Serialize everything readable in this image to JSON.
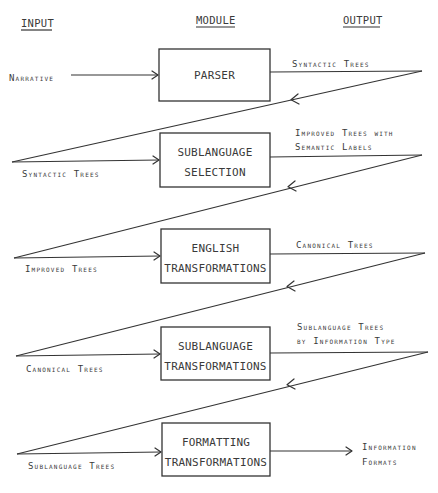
{
  "headers": {
    "input": "INPUT",
    "module": "MODULE",
    "output": "OUTPUT"
  },
  "modules": [
    {
      "lines": [
        "PARSER"
      ]
    },
    {
      "lines": [
        "SUBLANGUAGE",
        "SELECTION"
      ]
    },
    {
      "lines": [
        "ENGLISH",
        "TRANSFORMATIONS"
      ]
    },
    {
      "lines": [
        "SUBLANGUAGE",
        "TRANSFORMATIONS"
      ]
    },
    {
      "lines": [
        "FORMATTING",
        "TRANSFORMATIONS"
      ]
    }
  ],
  "inputs": [
    {
      "label": "Narrative"
    },
    {
      "label": "Syntactic Trees"
    },
    {
      "label": "Improved Trees"
    },
    {
      "label": "Canonical Trees"
    },
    {
      "label": "Sublanguage Trees"
    }
  ],
  "outputs": [
    {
      "lines": [
        "Syntactic Trees"
      ]
    },
    {
      "lines": [
        "Improved Trees with",
        "Semantic Labels"
      ]
    },
    {
      "lines": [
        "Canonical Trees"
      ]
    },
    {
      "lines": [
        "Sublanguage Trees",
        "by Information Type"
      ]
    },
    {
      "lines": [
        "Information",
        "Formats"
      ]
    }
  ],
  "colors": {
    "ink": "#333333",
    "background": "#ffffff"
  }
}
